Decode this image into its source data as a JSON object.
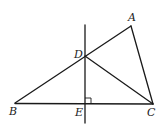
{
  "diagram": {
    "type": "geometry",
    "points": {
      "A": {
        "label": "A",
        "x": 131,
        "y": 26,
        "lx": 128,
        "ly": 21
      },
      "B": {
        "label": "B",
        "x": 15,
        "y": 103,
        "lx": 9,
        "ly": 115
      },
      "C": {
        "label": "C",
        "x": 153,
        "y": 104,
        "lx": 147,
        "ly": 116
      },
      "D": {
        "label": "D",
        "x": 85,
        "y": 56,
        "lx": 74,
        "ly": 58
      },
      "E": {
        "label": "E",
        "x": 85,
        "y": 104,
        "lx": 75,
        "ly": 116
      }
    },
    "segments": [
      "AB",
      "AC",
      "BC",
      "DC"
    ],
    "perpendicular_line": {
      "x": 85,
      "y1": 25,
      "y2": 123,
      "through": [
        "D",
        "E"
      ]
    },
    "right_angle_mark": {
      "at": "E",
      "size": 6
    },
    "labels": [
      "A",
      "B",
      "C",
      "D",
      "E"
    ]
  }
}
